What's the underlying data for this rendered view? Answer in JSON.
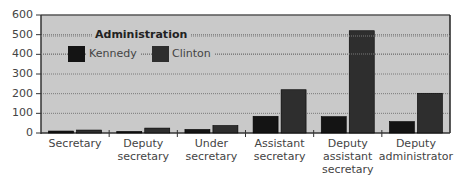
{
  "chart_data": {
    "type": "bar",
    "title": "",
    "xlabel": "",
    "ylabel": "",
    "ylim": [
      0,
      600
    ],
    "yticks": [
      0,
      100,
      200,
      300,
      400,
      500,
      600
    ],
    "grid": true,
    "legend": {
      "title": "Administration",
      "position": "upper-left-inside"
    },
    "categories": [
      "Secretary",
      "Deputy secretary",
      "Under secretary",
      "Assistant secretary",
      "Deputy assistant secretary",
      "Deputy administrator"
    ],
    "category_lines": [
      [
        "Secretary"
      ],
      [
        "Deputy",
        "secretary"
      ],
      [
        "Under",
        "secretary"
      ],
      [
        "Assistant",
        "secretary"
      ],
      [
        "Deputy",
        "assistant",
        "secretary"
      ],
      [
        "Deputy",
        "administrator"
      ]
    ],
    "series": [
      {
        "name": "Kennedy",
        "color": "#141414",
        "values": [
          10,
          8,
          18,
          85,
          83,
          58
        ]
      },
      {
        "name": "Clinton",
        "color": "#2e2e2e",
        "values": [
          15,
          25,
          38,
          220,
          520,
          202
        ]
      }
    ]
  },
  "colors": {
    "plot_background": "#c9c9c9",
    "gridline": "#7a7a7a",
    "axis": "#333333"
  }
}
